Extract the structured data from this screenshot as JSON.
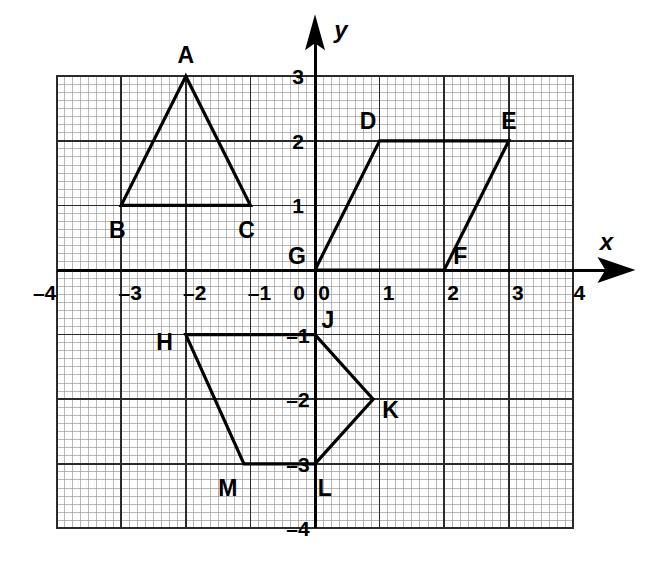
{
  "figure": {
    "type": "coordinate-plane-diagram",
    "background_color": "#ffffff",
    "ink_color": "#000000",
    "grid": {
      "major_color": "#2b2b2b",
      "minor_color": "#9a9a9a",
      "minor_per_unit": 8,
      "x_range": [
        -4,
        4
      ],
      "y_range": [
        -4,
        3
      ]
    },
    "axes": {
      "x_label": "x",
      "y_label": "y",
      "origin_label": "0"
    }
  },
  "axis_ticks": {
    "x": [
      {
        "value": -4,
        "label": "–4"
      },
      {
        "value": -3,
        "label": "–3"
      },
      {
        "value": -2,
        "label": "–2"
      },
      {
        "value": -1,
        "label": "–1"
      },
      {
        "value": 0,
        "label": "0"
      },
      {
        "value": 1,
        "label": "1"
      },
      {
        "value": 2,
        "label": "2"
      },
      {
        "value": 3,
        "label": "3"
      },
      {
        "value": 4,
        "label": "4"
      }
    ],
    "y": [
      {
        "value": 3,
        "label": "3"
      },
      {
        "value": 2,
        "label": "2"
      },
      {
        "value": 1,
        "label": "1"
      },
      {
        "value": -1,
        "label": "–1"
      },
      {
        "value": -2,
        "label": "–2"
      },
      {
        "value": -3,
        "label": "–3"
      },
      {
        "value": -4,
        "label": "–4"
      }
    ]
  },
  "chart_data": {
    "type": "scatter",
    "title": "",
    "xlabel": "x",
    "ylabel": "y",
    "xlim": [
      -4,
      4
    ],
    "ylim": [
      -4,
      3
    ],
    "grid": true,
    "legend": "none",
    "shapes": [
      {
        "name": "triangle-abc",
        "kind": "triangle",
        "closed": true,
        "vertices": [
          {
            "label": "A",
            "x": -2,
            "y": 3,
            "label_dx": 0,
            "label_dy": 0.33,
            "label_anchor": "middle"
          },
          {
            "label": "B",
            "x": -3,
            "y": 1,
            "label_dx": -0.06,
            "label_dy": -0.38,
            "label_anchor": "middle"
          },
          {
            "label": "C",
            "x": -1,
            "y": 1,
            "label_dx": -0.06,
            "label_dy": -0.38,
            "label_anchor": "middle"
          }
        ]
      },
      {
        "name": "parallelogram-defg",
        "kind": "parallelogram",
        "closed": true,
        "vertices": [
          {
            "label": "G",
            "x": 0,
            "y": 0,
            "label_dx": -0.28,
            "label_dy": 0.22,
            "label_anchor": "middle"
          },
          {
            "label": "D",
            "x": 1,
            "y": 2,
            "label_dx": -0.18,
            "label_dy": 0.3,
            "label_anchor": "middle"
          },
          {
            "label": "E",
            "x": 3,
            "y": 2,
            "label_dx": 0.0,
            "label_dy": 0.3,
            "label_anchor": "middle"
          },
          {
            "label": "F",
            "x": 2,
            "y": 0,
            "label_dx": 0.25,
            "label_dy": 0.22,
            "label_anchor": "middle"
          }
        ]
      },
      {
        "name": "pentagon-hjklm",
        "kind": "pentagon",
        "closed": true,
        "vertices": [
          {
            "label": "H",
            "x": -2,
            "y": -1,
            "label_dx": -0.33,
            "label_dy": -0.12,
            "label_anchor": "middle"
          },
          {
            "label": "J",
            "x": 0,
            "y": -1,
            "label_dx": 0.2,
            "label_dy": 0.22,
            "label_anchor": "middle"
          },
          {
            "label": "K",
            "x": 0.9,
            "y": -2,
            "label_dx": 0.27,
            "label_dy": -0.17,
            "label_anchor": "middle"
          },
          {
            "label": "L",
            "x": 0,
            "y": -3,
            "label_dx": 0.15,
            "label_dy": -0.38,
            "label_anchor": "middle"
          },
          {
            "label": "M",
            "x": -1.1,
            "y": -3,
            "label_dx": -0.25,
            "label_dy": -0.38,
            "label_anchor": "middle"
          }
        ]
      }
    ]
  }
}
